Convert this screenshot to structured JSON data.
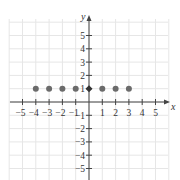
{
  "chart_data": {
    "type": "scatter",
    "title": "",
    "xlabel": "x",
    "ylabel": "y",
    "xlim": [
      -5.5,
      5.5
    ],
    "ylim": [
      -5.5,
      5.5
    ],
    "grid": true,
    "x_ticks": [
      -5,
      -4,
      -3,
      -2,
      -1,
      1,
      2,
      3,
      4,
      5
    ],
    "y_ticks": [
      -5,
      -4,
      -3,
      -2,
      -1,
      1,
      2,
      3,
      4,
      5
    ],
    "x_tick_labels": [
      "−5",
      "−4",
      "−3",
      "−2",
      "−1",
      "1",
      "2",
      "3",
      "4",
      "5"
    ],
    "y_tick_labels": [
      "−5",
      "−4",
      "−3",
      "−2",
      "−1",
      "1",
      "2",
      "3",
      "4",
      "5"
    ],
    "series": [
      {
        "name": "points",
        "x": [
          -4,
          -3,
          -2,
          -1,
          0,
          1,
          2,
          3
        ],
        "y": [
          1,
          1,
          1,
          1,
          1,
          1,
          1,
          1
        ]
      }
    ],
    "legend": null
  },
  "colors": {
    "grid": "#e6e6e6",
    "axis": "#444444",
    "point": "#6b6b6b",
    "text": "#333333"
  }
}
